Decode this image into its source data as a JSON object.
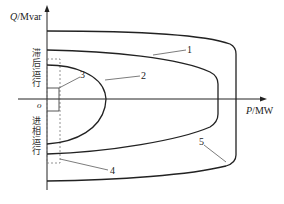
{
  "diagram": {
    "type": "generator P-Q capability diagram",
    "axes": {
      "y_label_var": "Q",
      "y_label_unit": "/Mvar",
      "x_label_var": "P",
      "x_label_unit": "/MW",
      "origin": "o"
    },
    "regions": {
      "upper": "滞后运行",
      "lower": "进相运行"
    },
    "curve_labels": [
      "1",
      "2",
      "3",
      "4",
      "5"
    ],
    "colors": {
      "line": "#222222",
      "dashed": "#777777",
      "background": "#ffffff"
    }
  }
}
